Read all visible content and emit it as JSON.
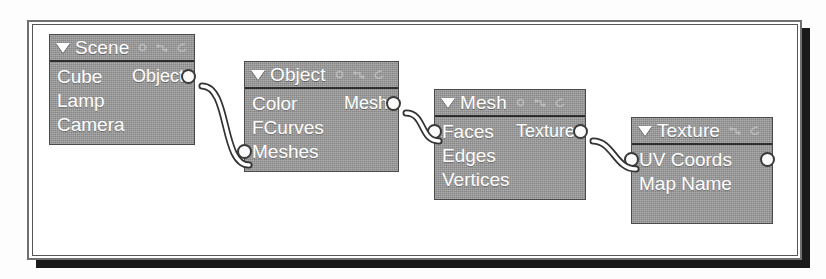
{
  "figure": {
    "type": "node-editor-graph",
    "node_fill_color": "#9a9a9a",
    "node_border_color": "#4a4a4a",
    "text_color": "#ffffff",
    "socket_color": "#fbfbfb",
    "wire_color": "#ffffff",
    "wire_outline_color": "#333333",
    "frame_shadow_color": "#1a1a1a"
  },
  "nodes": [
    {
      "id": "scene",
      "title": "Scene",
      "collapse_icon": "collapse-triangle-icon",
      "header_icons": [
        "node-options-icon",
        "node-sockets-icon",
        "node-preview-icon"
      ],
      "rows": [
        {
          "label": "Cube",
          "output": "Object",
          "has_output_socket": true,
          "has_input_socket": false
        },
        {
          "label": "Lamp",
          "output": "",
          "has_output_socket": false,
          "has_input_socket": false
        },
        {
          "label": "Camera",
          "output": "",
          "has_output_socket": false,
          "has_input_socket": false
        }
      ]
    },
    {
      "id": "object",
      "title": "Object",
      "collapse_icon": "collapse-triangle-icon",
      "header_icons": [
        "node-options-icon",
        "node-sockets-icon",
        "node-preview-icon"
      ],
      "rows": [
        {
          "label": "Color",
          "output": "Mesh",
          "has_output_socket": true,
          "has_input_socket": false
        },
        {
          "label": "FCurves",
          "output": "",
          "has_output_socket": false,
          "has_input_socket": false
        },
        {
          "label": "Meshes",
          "output": "",
          "has_output_socket": false,
          "has_input_socket": true
        }
      ]
    },
    {
      "id": "mesh",
      "title": "Mesh",
      "collapse_icon": "collapse-triangle-icon",
      "header_icons": [
        "node-options-icon",
        "node-sockets-icon",
        "node-preview-icon"
      ],
      "rows": [
        {
          "label": "Faces",
          "output": "Texture",
          "has_output_socket": true,
          "has_input_socket": true
        },
        {
          "label": "Edges",
          "output": "",
          "has_output_socket": false,
          "has_input_socket": false
        },
        {
          "label": "Vertices",
          "output": "",
          "has_output_socket": false,
          "has_input_socket": false
        }
      ]
    },
    {
      "id": "texture",
      "title": "Texture",
      "collapse_icon": "collapse-triangle-icon",
      "header_icons": [
        "node-sockets-icon",
        "node-preview-icon"
      ],
      "rows": [
        {
          "label": "UV Coords",
          "output": "",
          "has_output_socket": true,
          "has_input_socket": true
        },
        {
          "label": "Map Name",
          "output": "",
          "has_output_socket": false,
          "has_input_socket": false
        }
      ]
    }
  ],
  "connections": [
    {
      "from_node": "scene",
      "from_socket": "Object",
      "to_node": "object",
      "to_socket": "Meshes"
    },
    {
      "from_node": "object",
      "from_socket": "Mesh",
      "to_node": "mesh",
      "to_socket": "Faces"
    },
    {
      "from_node": "mesh",
      "from_socket": "Texture",
      "to_node": "texture",
      "to_socket": "UV Coords"
    }
  ]
}
